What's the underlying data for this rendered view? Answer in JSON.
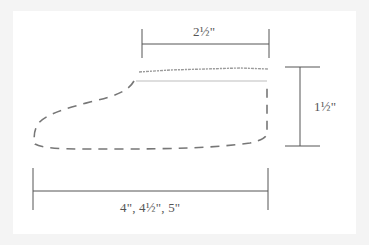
{
  "diagram": {
    "type": "knitting-schematic",
    "shape": "slipper-sole-outline",
    "labels": {
      "top_width": "2½\"",
      "height": "1½\"",
      "bottom_width": "4\", 4½\", 5\""
    },
    "colors": {
      "background": "#f4f4f4",
      "panel": "#ffffff",
      "line": "#555555",
      "dashed_outline": "#777777",
      "top_edge": "#9a9a9a"
    }
  }
}
